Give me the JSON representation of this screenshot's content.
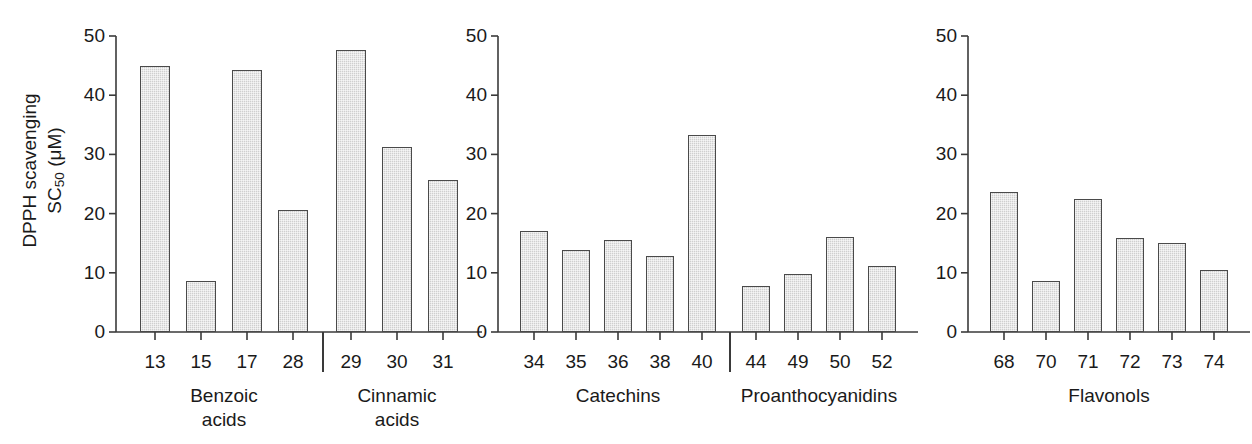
{
  "figure": {
    "background": "#ffffff",
    "bar_fill": "#cfcfcf",
    "bar_stroke": "#4a4a4a",
    "axis_color": "#3a3a3a"
  },
  "axis": {
    "y_title_line1": "DPPH scavenging",
    "y_title_line2_pre": "SC",
    "y_title_line2_sub": "50",
    "y_title_line2_post": " (μM)",
    "y_ticks": [
      "50",
      "40",
      "30",
      "20",
      "10",
      "0"
    ],
    "y_min": 0,
    "y_max": 50
  },
  "chart_data": {
    "type": "bar",
    "title": "",
    "xlabel": "",
    "ylabel": "DPPH scavenging SC50 (μM)",
    "ylim": [
      0,
      50
    ],
    "yticks": [
      0,
      10,
      20,
      30,
      40,
      50
    ],
    "grid": false,
    "legend": "none",
    "panels": [
      {
        "panel_index": 1,
        "groups": [
          {
            "name": "Benzoic acids",
            "name_lines": [
              "Benzoic",
              "acids"
            ],
            "categories": [
              "13",
              "15",
              "17",
              "28"
            ],
            "values": [
              44.9,
              8.6,
              44.3,
              20.6
            ]
          },
          {
            "name": "Cinnamic acids",
            "name_lines": [
              "Cinnamic",
              "acids"
            ],
            "categories": [
              "29",
              "30",
              "31"
            ],
            "values": [
              47.6,
              31.3,
              25.7
            ]
          }
        ]
      },
      {
        "panel_index": 2,
        "groups": [
          {
            "name": "Catechins",
            "name_lines": [
              "Catechins"
            ],
            "categories": [
              "34",
              "35",
              "36",
              "38",
              "40"
            ],
            "values": [
              17.0,
              13.8,
              15.5,
              12.8,
              33.2
            ]
          },
          {
            "name": "Proanthocyanidins",
            "name_lines": [
              "Proanthocyanidins"
            ],
            "categories": [
              "44",
              "49",
              "50",
              "52"
            ],
            "values": [
              7.7,
              9.8,
              16.1,
              11.1
            ]
          }
        ]
      },
      {
        "panel_index": 3,
        "groups": [
          {
            "name": "Flavonols",
            "name_lines": [
              "Flavonols"
            ],
            "categories": [
              "68",
              "70",
              "71",
              "72",
              "73",
              "74"
            ],
            "values": [
              23.7,
              8.7,
              22.4,
              15.9,
              15.1,
              10.5
            ]
          }
        ]
      }
    ]
  },
  "layout": {
    "panels": [
      {
        "left": 86,
        "axis_x": 30,
        "plot_width": 362,
        "bar_slot": 46,
        "bar_width": 30,
        "first_bar_offset": 24,
        "group_gap": 12
      },
      {
        "left": 468,
        "axis_x": 30,
        "plot_width": 410,
        "bar_slot": 42,
        "bar_width": 28,
        "first_bar_offset": 22,
        "group_gap": 12
      },
      {
        "left": 938,
        "axis_x": 30,
        "plot_width": 300,
        "bar_slot": 42,
        "bar_width": 28,
        "first_bar_offset": 22,
        "group_gap": 0
      }
    ]
  }
}
